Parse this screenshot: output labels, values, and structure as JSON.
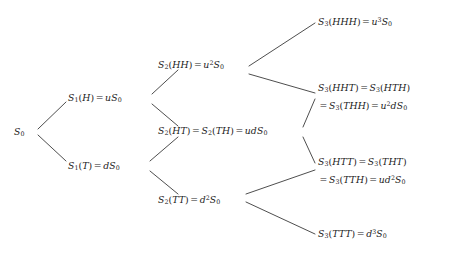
{
  "figure": {
    "type": "binomial-asset-pricing-tree",
    "background_color": "#ffffff",
    "line_color": "#3a3a3a",
    "text_color": "#1a1a1a"
  },
  "nodes": {
    "root": {
      "id": "S0",
      "label": "S_0",
      "parts": {
        "base": "S",
        "sub": "0"
      }
    },
    "level1_up": {
      "id": "S1_H",
      "label": "S_1(H) = uS_0",
      "parts": {
        "fn": "S",
        "fn_sub": "1",
        "arg": "(H)",
        "eq": "=",
        "value": "uS",
        "value_sub": "0"
      }
    },
    "level1_down": {
      "id": "S1_T",
      "label": "S_1(T) = dS_0",
      "parts": {
        "fn": "S",
        "fn_sub": "1",
        "arg": "(T)",
        "eq": "=",
        "value": "dS",
        "value_sub": "0"
      }
    },
    "level2_uu": {
      "id": "S2_HH",
      "label": "S_2(HH) = u^2 S_0"
    },
    "level2_ud": {
      "id": "S2_HT",
      "label": "S_2(HT) = S_2(TH) = udS_0"
    },
    "level2_dd": {
      "id": "S2_TT",
      "label": "S_2(TT) = d^2 S_0"
    },
    "level3_uuu": {
      "id": "S3_HHH",
      "line1": "S_3(HHH) = u^3 S_0"
    },
    "level3_uud": {
      "id": "S3_HHT",
      "line1": "S_3(HHT) = S_3(HTH)",
      "line2": "= S_3(THH) = u^2 dS_0"
    },
    "level3_udd": {
      "id": "S3_HTT",
      "line1": "S_3(HTT) = S_3(THT)",
      "line2": "= S_3(TTH) = ud^2 S_0"
    },
    "level3_ddd": {
      "id": "S3_TTT",
      "line1": "S_3(TTT) = d^3 S_0"
    }
  },
  "edges": [
    {
      "from": "S0",
      "to": "S1_H",
      "direction": "up"
    },
    {
      "from": "S0",
      "to": "S1_T",
      "direction": "down"
    },
    {
      "from": "S1_H",
      "to": "S2_HH",
      "direction": "up"
    },
    {
      "from": "S1_H",
      "to": "S2_HT",
      "direction": "down"
    },
    {
      "from": "S1_T",
      "to": "S2_HT",
      "direction": "up"
    },
    {
      "from": "S1_T",
      "to": "S2_TT",
      "direction": "down"
    },
    {
      "from": "S2_HH",
      "to": "S3_HHH",
      "direction": "up"
    },
    {
      "from": "S2_HH",
      "to": "S3_HHT",
      "direction": "down"
    },
    {
      "from": "S2_HT",
      "to": "S3_HHT",
      "direction": "up"
    },
    {
      "from": "S2_HT",
      "to": "S3_HTT",
      "direction": "down"
    },
    {
      "from": "S2_TT",
      "to": "S3_HTT",
      "direction": "up"
    },
    {
      "from": "S2_TT",
      "to": "S3_TTT",
      "direction": "down"
    }
  ]
}
